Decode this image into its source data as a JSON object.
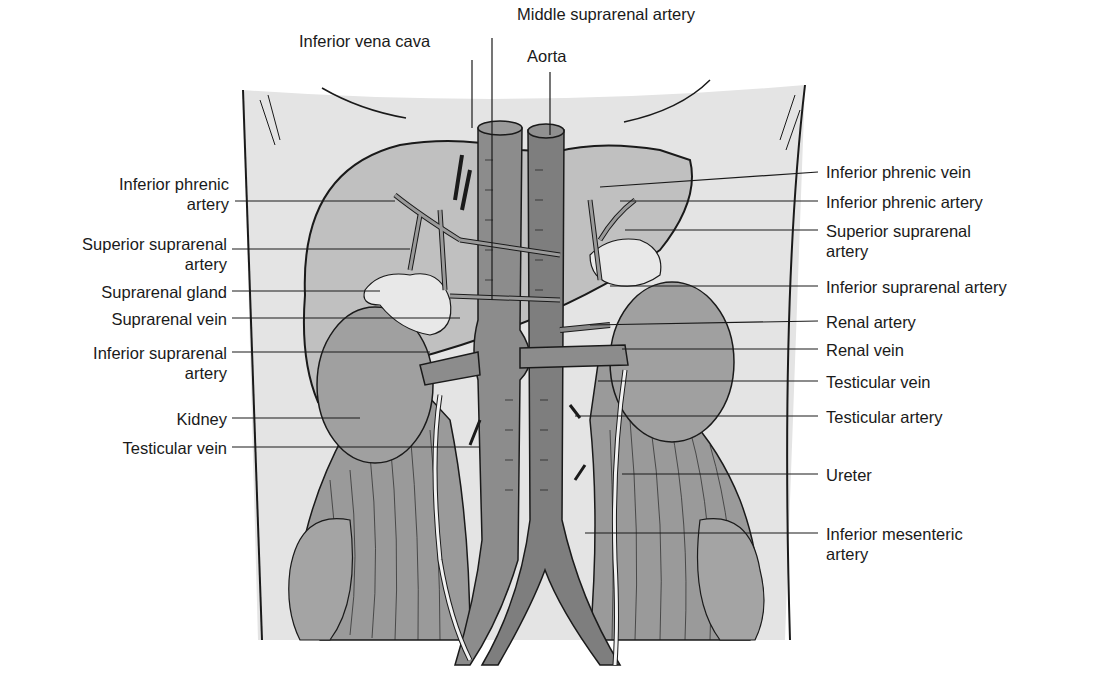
{
  "figure": {
    "colors": {
      "background": "#ffffff",
      "body_wall": "#e4e4e4",
      "organ_fill": "#a8a8a8",
      "vessel_fill": "#8a8a8a",
      "gland_fill": "#e8e8e8",
      "muscle_fill": "#9a9a9a",
      "line": "#1a1a1a"
    }
  },
  "labels": {
    "top": {
      "middle_suprarenal_artery": "Middle suprarenal artery",
      "inferior_vena_cava": "Inferior vena cava",
      "aorta": "Aorta"
    },
    "left": [
      {
        "id": "inferior-phrenic-artery-left",
        "line1": "Inferior phrenic",
        "line2": "artery"
      },
      {
        "id": "superior-suprarenal-artery-left",
        "line1": "Superior suprarenal",
        "line2": "artery"
      },
      {
        "id": "suprarenal-gland",
        "line1": "Suprarenal gland",
        "line2": ""
      },
      {
        "id": "suprarenal-vein",
        "line1": "Suprarenal vein",
        "line2": ""
      },
      {
        "id": "inferior-suprarenal-artery-left",
        "line1": "Inferior suprarenal",
        "line2": "artery"
      },
      {
        "id": "kidney",
        "line1": "Kidney",
        "line2": ""
      },
      {
        "id": "testicular-vein-left",
        "line1": "Testicular vein",
        "line2": ""
      }
    ],
    "right": [
      {
        "id": "inferior-phrenic-vein",
        "line1": "Inferior phrenic vein",
        "line2": ""
      },
      {
        "id": "inferior-phrenic-artery-right",
        "line1": "Inferior phrenic artery",
        "line2": ""
      },
      {
        "id": "superior-suprarenal-artery-right",
        "line1": "Superior suprarenal",
        "line2": "artery"
      },
      {
        "id": "inferior-suprarenal-artery-right",
        "line1": "Inferior suprarenal artery",
        "line2": ""
      },
      {
        "id": "renal-artery",
        "line1": "Renal artery",
        "line2": ""
      },
      {
        "id": "renal-vein",
        "line1": "Renal vein",
        "line2": ""
      },
      {
        "id": "testicular-vein-right",
        "line1": "Testicular vein",
        "line2": ""
      },
      {
        "id": "testicular-artery",
        "line1": "Testicular artery",
        "line2": ""
      },
      {
        "id": "ureter",
        "line1": "Ureter",
        "line2": ""
      },
      {
        "id": "inferior-mesenteric-artery",
        "line1": "Inferior mesenteric",
        "line2": "artery"
      }
    ]
  }
}
